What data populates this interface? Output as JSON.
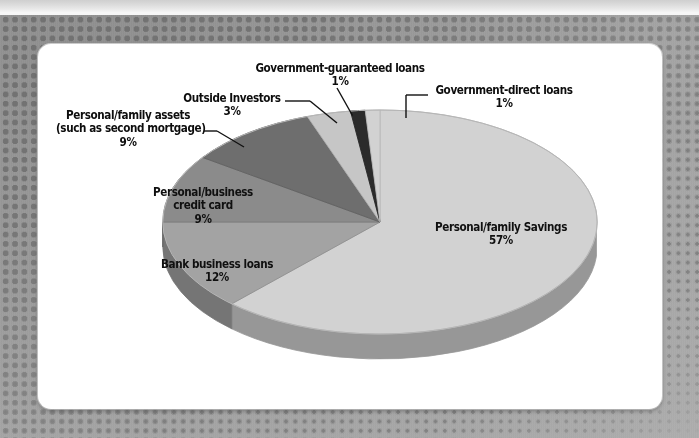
{
  "page": {
    "card_background": "#ffffff",
    "backdrop_color": "#9d9d9d",
    "dot_color": "#6f6f6f"
  },
  "chart_data": {
    "type": "pie",
    "title": "",
    "subtitle": "",
    "xlabel": "",
    "ylabel": "",
    "legend_position": "callout-labels",
    "grid": false,
    "units": "percent",
    "three_d": true,
    "start_angle_deg": -90,
    "direction": "clockwise",
    "total": 92,
    "categories": [
      "Personal/family Savings",
      "Bank business loans",
      "Personal/business credit card",
      "Personal/family assets (such as second mortgage)",
      "Outside Investors",
      "Government-guaranteed loans",
      "Government-direct loans"
    ],
    "values": [
      57,
      12,
      9,
      9,
      3,
      1,
      1
    ],
    "labels": [
      "57%",
      "12%",
      "9%",
      "9%",
      "3%",
      "1%",
      "1%"
    ],
    "colors": [
      "#d2d2d2",
      "#a3a3a3",
      "#8b8b8b",
      "#6e6e6e",
      "#c6c6c6",
      "#2b2b2b",
      "#d2d2d2"
    ],
    "slices": [
      {
        "name": "Personal/family Savings",
        "value": 57,
        "label": "57%",
        "color": "#d2d2d2",
        "callout": false
      },
      {
        "name": "Bank business loans",
        "value": 12,
        "label": "12%",
        "color": "#a3a3a3",
        "callout": false
      },
      {
        "name": "Personal/business credit card",
        "value": 9,
        "label": "9%",
        "color": "#8b8b8b",
        "callout": false
      },
      {
        "name": "Personal/family assets (such as second mortgage)",
        "value": 9,
        "label": "9%",
        "color": "#6e6e6e",
        "callout": true
      },
      {
        "name": "Outside Investors",
        "value": 3,
        "label": "3%",
        "color": "#c6c6c6",
        "callout": true
      },
      {
        "name": "Government-guaranteed loans",
        "value": 1,
        "label": "1%",
        "color": "#2b2b2b",
        "callout": true
      },
      {
        "name": "Government-direct loans",
        "value": 1,
        "label": "1%",
        "color": "#d2d2d2",
        "callout": true
      }
    ]
  },
  "labels": {
    "gov_guaranteed": {
      "line1": "Government-guaranteed loans",
      "pct": "1%"
    },
    "gov_direct": {
      "line1": "Government-direct loans",
      "pct": "1%"
    },
    "outside_investors": {
      "line1": "Outside Investors",
      "pct": "3%"
    },
    "family_assets": {
      "line1": "Personal/family assets",
      "line2": "(such as second mortgage)",
      "pct": "9%"
    },
    "credit_card": {
      "line1": "Personal/business",
      "line2": "credit card",
      "pct": "9%"
    },
    "bank_loans": {
      "line1": "Bank business loans",
      "pct": "12%"
    },
    "family_savings": {
      "line1": "Personal/family Savings",
      "pct": "57%"
    }
  }
}
